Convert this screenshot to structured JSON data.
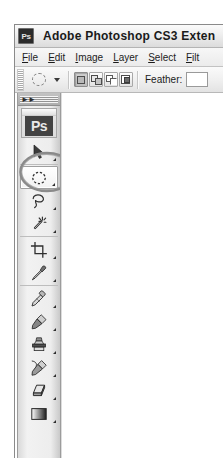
{
  "window": {
    "title": "Adobe Photoshop CS3 Exten",
    "app_icon": "photoshop-app-icon",
    "icon_label": "Ps"
  },
  "menubar": {
    "items": [
      {
        "label": "File",
        "mnemonic": "F"
      },
      {
        "label": "Edit",
        "mnemonic": "E"
      },
      {
        "label": "Image",
        "mnemonic": "I"
      },
      {
        "label": "Layer",
        "mnemonic": "L"
      },
      {
        "label": "Select",
        "mnemonic": "S"
      },
      {
        "label": "Filt",
        "mnemonic": "F"
      }
    ]
  },
  "options_bar": {
    "tool_preset": {
      "icon": "elliptical-marquee-icon",
      "dropdown_icon": "chevron-down-icon"
    },
    "selection_modes": [
      {
        "name": "new-selection",
        "title": "New selection",
        "active": true
      },
      {
        "name": "add-to-selection",
        "title": "Add to selection",
        "active": false
      },
      {
        "name": "subtract-from-selection",
        "title": "Subtract from selection",
        "active": false
      },
      {
        "name": "intersect-with-selection",
        "title": "Intersect with selection",
        "active": false
      }
    ],
    "feather": {
      "label": "Feather:",
      "value": "",
      "placeholder": ""
    }
  },
  "toolbox": {
    "collapse_icon": "double-chevron-right-icon",
    "logo_label": "Ps",
    "groups": [
      {
        "tools": [
          {
            "name": "move-tool",
            "icon": "move-arrow-icon",
            "has_flyout": true,
            "selected": false
          }
        ]
      },
      {
        "tools": [
          {
            "name": "elliptical-marquee-tool",
            "icon": "elliptical-marquee-icon",
            "has_flyout": true,
            "selected": true
          },
          {
            "name": "lasso-tool",
            "icon": "lasso-icon",
            "has_flyout": true,
            "selected": false
          },
          {
            "name": "magic-wand-tool",
            "icon": "magic-wand-icon",
            "has_flyout": true,
            "selected": false
          }
        ]
      },
      {
        "tools": [
          {
            "name": "crop-tool",
            "icon": "crop-icon",
            "has_flyout": true,
            "selected": false
          },
          {
            "name": "eyedropper-tool",
            "icon": "eyedropper-icon",
            "has_flyout": true,
            "selected": false
          }
        ]
      },
      {
        "tools": [
          {
            "name": "healing-brush-tool",
            "icon": "healing-brush-icon",
            "has_flyout": true,
            "selected": false
          },
          {
            "name": "brush-tool",
            "icon": "brush-icon",
            "has_flyout": true,
            "selected": false
          },
          {
            "name": "clone-stamp-tool",
            "icon": "clone-stamp-icon",
            "has_flyout": true,
            "selected": false
          },
          {
            "name": "history-brush-tool",
            "icon": "history-brush-icon",
            "has_flyout": true,
            "selected": false
          },
          {
            "name": "eraser-tool",
            "icon": "eraser-icon",
            "has_flyout": true,
            "selected": false
          },
          {
            "name": "gradient-tool",
            "icon": "gradient-icon",
            "has_flyout": true,
            "selected": false
          }
        ]
      }
    ]
  },
  "annotation": {
    "shape": "hand-drawn-ellipse",
    "target": "elliptical-marquee-tool",
    "color": "#8a8a8a"
  },
  "colors": {
    "titlebar_text": "#1a1a1a",
    "chrome": "#ececec",
    "toolbox_bg": "#ededed",
    "selected_tool_bg": "#f7f7f7",
    "canvas": "#ffffff",
    "annotation": "#8a8a8a"
  }
}
